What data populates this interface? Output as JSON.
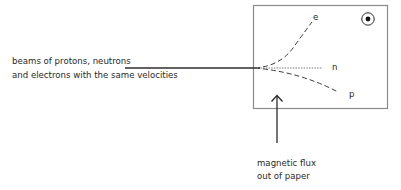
{
  "diagram": {
    "beam_label": {
      "line1": "beams of protons, neutrons",
      "line2": "and electrons with the same velocities"
    },
    "field_label": {
      "line1": "magnetic flux",
      "line2": "out of paper"
    },
    "particles": [
      {
        "name": "electron",
        "label": "e",
        "path": "curves up"
      },
      {
        "name": "neutron",
        "label": "n",
        "path": "straight"
      },
      {
        "name": "proton",
        "label": "p",
        "path": "curves down"
      }
    ],
    "field_symbol": "dot-in-circle (field out of page)",
    "colors": {
      "box": "#8a8a8a",
      "lines": "#3a3a3a",
      "text": "#2a2a2a"
    }
  }
}
